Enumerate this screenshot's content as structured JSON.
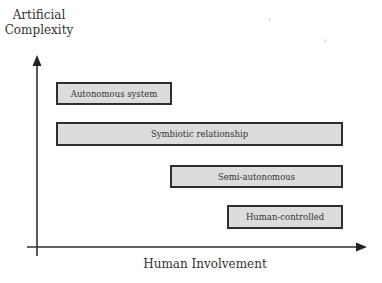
{
  "diagram": {
    "y_axis_label_line1": "Artificial",
    "y_axis_label_line2": "Complexity",
    "x_axis_label": "Human Involvement",
    "boxes": [
      {
        "label": "Autonomous system",
        "x": 56,
        "y": 82,
        "w": 116,
        "h": 23
      },
      {
        "label": "Symbiotic relationship",
        "x": 56,
        "y": 122,
        "w": 287,
        "h": 24
      },
      {
        "label": "Semi-autonomous",
        "x": 170,
        "y": 165,
        "w": 173,
        "h": 23
      },
      {
        "label": "Human-controlled",
        "x": 227,
        "y": 205,
        "w": 116,
        "h": 24
      }
    ],
    "colors": {
      "box_fill": "#dcdcdc",
      "box_border": "#2e2e2e",
      "axis": "#2e2e2e",
      "background": "#ffffff"
    }
  }
}
